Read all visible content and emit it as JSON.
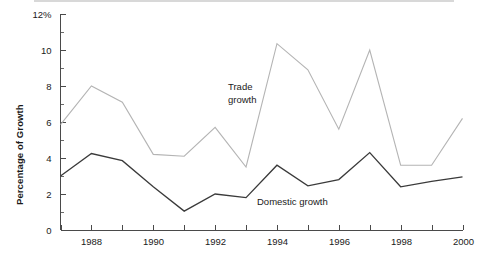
{
  "chart_data": {
    "type": "line",
    "title": "",
    "subtitle": "",
    "xlabel": "",
    "ylabel": "Percentage of Growth",
    "x": [
      1987,
      1988,
      1989,
      1990,
      1991,
      1992,
      1993,
      1994,
      1995,
      1996,
      1997,
      1998,
      1999,
      2000
    ],
    "xlim": [
      1987,
      2000
    ],
    "ylim": [
      0,
      12
    ],
    "ytick_labels": [
      "0",
      "2",
      "4",
      "6",
      "8",
      "10",
      "12%"
    ],
    "ytick_values": [
      0,
      2,
      4,
      6,
      8,
      10,
      12
    ],
    "yminor_values": [
      1,
      3,
      5,
      7,
      9,
      11
    ],
    "xtick_values": [
      1987,
      1988,
      1989,
      1990,
      1991,
      1992,
      1993,
      1994,
      1995,
      1996,
      1997,
      1998,
      1999,
      2000
    ],
    "xtick_labels": [
      "",
      "1988",
      "",
      "1990",
      "",
      "1992",
      "",
      "1994",
      "",
      "1996",
      "",
      "1998",
      "",
      "2000"
    ],
    "grid": false,
    "legend_position": "inline-annotations",
    "series": [
      {
        "name": "Trade growth",
        "color": "#b4b4b4",
        "label_line_1": "Trade",
        "label_line_2": "growth",
        "values": [
          5.85,
          8.0,
          7.1,
          4.2,
          4.1,
          5.7,
          3.5,
          10.35,
          8.9,
          5.6,
          10.0,
          3.6,
          3.6,
          6.2
        ]
      },
      {
        "name": "Domestic growth",
        "color": "#3a3a3a",
        "label_line_1": "Domestic growth",
        "label_line_2": "",
        "values": [
          3.0,
          4.25,
          3.85,
          2.4,
          1.05,
          2.0,
          1.8,
          3.6,
          2.45,
          2.8,
          4.3,
          2.4,
          2.7,
          2.95
        ]
      }
    ]
  },
  "annotations": {
    "trade_label_line1": "Trade",
    "trade_label_line2": "growth",
    "domestic_label": "Domestic growth"
  },
  "axes": {
    "y_axis_title": "Percentage of Growth"
  }
}
